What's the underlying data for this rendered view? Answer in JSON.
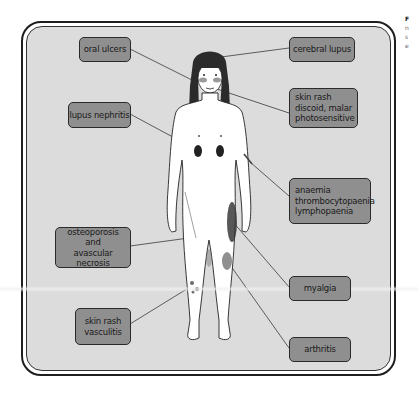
{
  "figure": {
    "background_color": "#dcdcdc",
    "label_color": "#8f8f8f",
    "border_color": "#1e1e1e"
  },
  "labels": {
    "oral_ulcers": [
      "oral ulcers"
    ],
    "cerebral_lupus": [
      "cerebral lupus"
    ],
    "skin_rash_discoid": [
      "skin rash",
      "discoid, malar",
      "photosensitive"
    ],
    "lupus_nephritis": [
      "lupus nephritis"
    ],
    "anaemia": [
      "anaemia",
      "thrombocytopaenia",
      "lymphopaenia"
    ],
    "osteoporosis": [
      "osteoporosis",
      "and",
      "avascular necrosis"
    ],
    "myalgia": [
      "myalgia"
    ],
    "skin_rash_vasculitis": [
      "skin rash",
      "vasculitis"
    ],
    "arthritis": [
      "arthritis"
    ]
  },
  "side_text": {
    "lines": [
      "F",
      "n",
      "s",
      "e"
    ]
  }
}
